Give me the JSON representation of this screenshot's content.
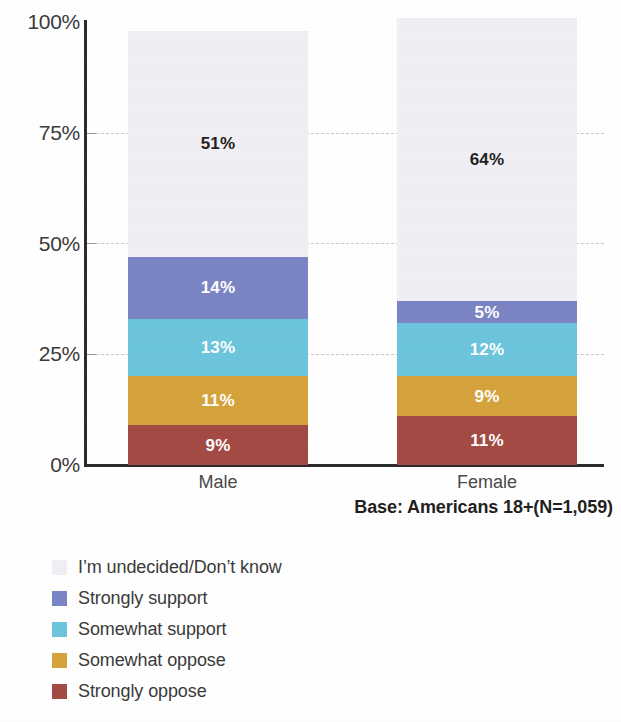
{
  "chart_data": {
    "type": "bar",
    "subtype": "stacked-100-percent",
    "title": "",
    "xlabel": "",
    "ylabel": "",
    "categories": [
      "Male",
      "Female"
    ],
    "ylim": [
      0,
      100
    ],
    "ytick_labels": [
      "100%",
      "75%",
      "50%",
      "25%",
      "0%"
    ],
    "ytick_values": [
      100,
      75,
      50,
      25,
      0
    ],
    "grid": true,
    "grid_style": "dashed",
    "legend_position": "bottom-left",
    "stack_order_bottom_to_top": [
      "Strongly oppose",
      "Somewhat oppose",
      "Somewhat support",
      "Strongly support",
      "I'm undecided/Don't know"
    ],
    "series": [
      {
        "name": "I’m undecided/Don’t know",
        "color": "#f1eff6",
        "label_color": "#231f20",
        "values": [
          51,
          64
        ],
        "value_labels": [
          "51%",
          "64%"
        ]
      },
      {
        "name": "Strongly support",
        "color": "#7b85c4",
        "label_color": "#ffffff",
        "values": [
          14,
          5
        ],
        "value_labels": [
          "14%",
          "5%"
        ]
      },
      {
        "name": "Somewhat support",
        "color": "#6cc5dc",
        "label_color": "#ffffff",
        "values": [
          13,
          12
        ],
        "value_labels": [
          "13%",
          "12%"
        ]
      },
      {
        "name": "Somewhat oppose",
        "color": "#d5a33c",
        "label_color": "#ffffff",
        "values": [
          11,
          9
        ],
        "value_labels": [
          "11%",
          "9%"
        ]
      },
      {
        "name": "Strongly oppose",
        "color": "#a34a44",
        "label_color": "#ffffff",
        "values": [
          9,
          11
        ],
        "value_labels": [
          "9%",
          "11%"
        ]
      }
    ],
    "annotations": [
      "Base: Americans 18+(N=1,059)"
    ]
  },
  "axis": {
    "y_ticks": [
      {
        "label": "100%",
        "value": 100
      },
      {
        "label": "75%",
        "value": 75
      },
      {
        "label": "50%",
        "value": 50
      },
      {
        "label": "25%",
        "value": 25
      },
      {
        "label": "0%",
        "value": 0
      }
    ],
    "x_categories": [
      {
        "label": "Male"
      },
      {
        "label": "Female"
      }
    ]
  },
  "bars": {
    "male": {
      "category": "Male",
      "segments": [
        {
          "name": "I’m undecided/Don’t know",
          "value": 51,
          "label": "51%",
          "color": "#f1eff6",
          "text": "dark"
        },
        {
          "name": "Strongly support",
          "value": 14,
          "label": "14%",
          "color": "#7b85c4",
          "text": "light"
        },
        {
          "name": "Somewhat support",
          "value": 13,
          "label": "13%",
          "color": "#6cc5dc",
          "text": "light"
        },
        {
          "name": "Somewhat oppose",
          "value": 11,
          "label": "11%",
          "color": "#d5a33c",
          "text": "light"
        },
        {
          "name": "Strongly oppose",
          "value": 9,
          "label": "9%",
          "color": "#a34a44",
          "text": "light"
        }
      ]
    },
    "female": {
      "category": "Female",
      "segments": [
        {
          "name": "I’m undecided/Don’t know",
          "value": 64,
          "label": "64%",
          "color": "#f1eff6",
          "text": "dark"
        },
        {
          "name": "Strongly support",
          "value": 5,
          "label": "5%",
          "color": "#7b85c4",
          "text": "light"
        },
        {
          "name": "Somewhat support",
          "value": 12,
          "label": "12%",
          "color": "#6cc5dc",
          "text": "light"
        },
        {
          "name": "Somewhat oppose",
          "value": 9,
          "label": "9%",
          "color": "#d5a33c",
          "text": "light"
        },
        {
          "name": "Strongly oppose",
          "value": 11,
          "label": "11%",
          "color": "#a34a44",
          "text": "light"
        }
      ]
    }
  },
  "base_note": "Base: Americans 18+(N=1,059)",
  "legend": {
    "items": [
      {
        "label": "I’m undecided/Don’t know",
        "color": "#f1eff6"
      },
      {
        "label": "Strongly support",
        "color": "#7b85c4"
      },
      {
        "label": "Somewhat support",
        "color": "#6cc5dc"
      },
      {
        "label": "Somewhat oppose",
        "color": "#d5a33c"
      },
      {
        "label": "Strongly oppose",
        "color": "#a34a44"
      }
    ]
  }
}
